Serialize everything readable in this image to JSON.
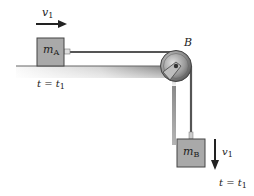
{
  "diagram": {
    "type": "physics-pulley-system",
    "block_a": {
      "mass_symbol": "m",
      "mass_subscript": "A",
      "velocity_symbol": "v",
      "velocity_subscript": "1",
      "velocity_direction": "right",
      "time_label": "t = t",
      "time_subscript": "1"
    },
    "pulley": {
      "label": "B"
    },
    "block_b": {
      "mass_symbol": "m",
      "mass_subscript": "B",
      "velocity_symbol": "v",
      "velocity_subscript": "1",
      "velocity_direction": "down",
      "time_label": "t = t",
      "time_subscript": "1"
    },
    "colors": {
      "block_fill": "#a9a9a9",
      "block_stroke": "#444444",
      "rope": "#555555",
      "surface_gradient_start": "#6f6f6f",
      "surface_gradient_end": "#ffffff",
      "arrow": "#222222"
    }
  }
}
